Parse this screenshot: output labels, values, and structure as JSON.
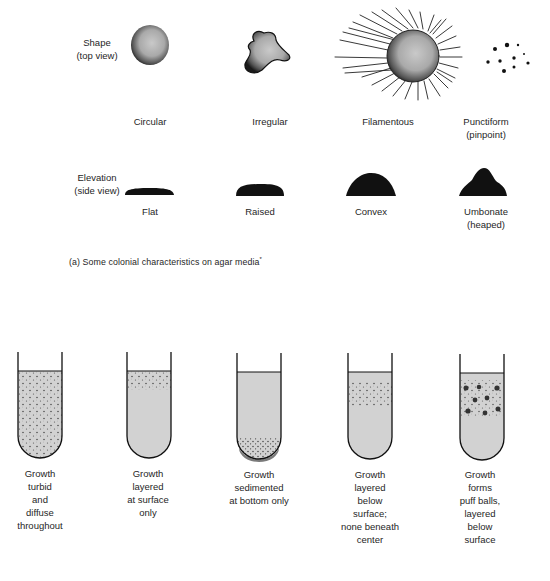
{
  "figure": {
    "part_a": {
      "caption": "(a) Some colonial characteristics on agar media",
      "caption_mark": "*",
      "rows": [
        {
          "label_line1": "Shape",
          "label_line2": "(top view)",
          "items": [
            {
              "name": "Circular",
              "sub": ""
            },
            {
              "name": "Irregular",
              "sub": ""
            },
            {
              "name": "Filamentous",
              "sub": ""
            },
            {
              "name": "Punctiform",
              "sub": "(pinpoint)"
            }
          ]
        },
        {
          "label_line1": "Elevation",
          "label_line2": "(side view)",
          "items": [
            {
              "name": "Flat",
              "sub": ""
            },
            {
              "name": "Raised",
              "sub": ""
            },
            {
              "name": "Convex",
              "sub": ""
            },
            {
              "name": "Umbonate",
              "sub": "(heaped)"
            }
          ]
        }
      ]
    },
    "part_b": {
      "tubes": [
        {
          "lines": [
            "Growth",
            "turbid",
            "and",
            "diffuse",
            "throughout"
          ]
        },
        {
          "lines": [
            "Growth",
            "layered",
            "at surface",
            "only"
          ]
        },
        {
          "lines": [
            "Growth",
            "sedimented",
            "at bottom only"
          ]
        },
        {
          "lines": [
            "Growth",
            "layered",
            "below",
            "surface;",
            "none beneath",
            "center"
          ]
        },
        {
          "lines": [
            "Growth",
            "forms",
            "puff balls,",
            "layered",
            "below",
            "surface"
          ]
        }
      ]
    },
    "colors": {
      "ink": "#111111",
      "medium": "#cfcfcf",
      "text": "#262626",
      "background": "#ffffff"
    }
  }
}
